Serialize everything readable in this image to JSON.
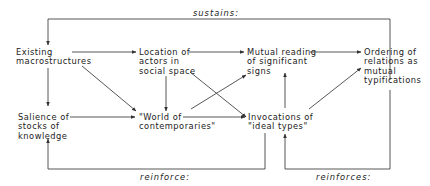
{
  "diagram": {
    "nodes": [
      {
        "id": "existing",
        "label": "Existing\nmacrostructures"
      },
      {
        "id": "location",
        "label": "Location of\nactors in\nsocial space"
      },
      {
        "id": "mutual",
        "label": "Mutual reading\nof significant\nsigns"
      },
      {
        "id": "ordering",
        "label": "Ordering of\nrelations as\nmutual\ntypifications"
      },
      {
        "id": "salience",
        "label": "Salience of\nstocks of\nknowledge"
      },
      {
        "id": "world",
        "label": "\"World of\ncontemporaries\""
      },
      {
        "id": "invocations",
        "label": "Invocations of\n\"ideal types\""
      }
    ],
    "edge_labels": {
      "sustains": "sustains:",
      "reinforce": "reinforce:",
      "reinforces": "reinforces:"
    },
    "edges": [
      {
        "from": "existing",
        "to": "location"
      },
      {
        "from": "location",
        "to": "mutual"
      },
      {
        "from": "mutual",
        "to": "ordering"
      },
      {
        "from": "existing",
        "to": "salience"
      },
      {
        "from": "existing",
        "to": "world"
      },
      {
        "from": "location",
        "to": "world"
      },
      {
        "from": "location",
        "to": "invocations"
      },
      {
        "from": "salience",
        "to": "world"
      },
      {
        "from": "world",
        "to": "mutual"
      },
      {
        "from": "world",
        "to": "invocations"
      },
      {
        "from": "invocations",
        "to": "ordering"
      },
      {
        "from": "ordering",
        "to": "existing",
        "label": "sustains:"
      },
      {
        "from": "invocations",
        "to": "salience",
        "label": "reinforce:"
      },
      {
        "from": "ordering",
        "to": "invocations",
        "label": "reinforces:"
      }
    ]
  }
}
